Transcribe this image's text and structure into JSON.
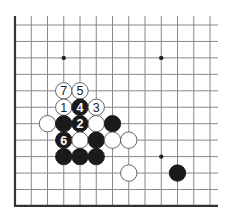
{
  "diagram": {
    "type": "go-board-fragment",
    "grid": {
      "columns": 13,
      "rows": 12,
      "origin_x": 15,
      "origin_y": 25,
      "spacing_x": 16.25,
      "spacing_y": 16.45,
      "extend_top": 9,
      "extend_right": 8,
      "left_edge": true,
      "bottom_edge": true,
      "line_color": "#888888",
      "edge_color": "#333333"
    },
    "star_points": [
      {
        "col": 3,
        "row": 2
      },
      {
        "col": 9,
        "row": 2
      },
      {
        "col": 9,
        "row": 8
      }
    ],
    "stones": [
      {
        "col": 3,
        "row": 4,
        "color": "white",
        "label": "7"
      },
      {
        "col": 4,
        "row": 4,
        "color": "white",
        "label": "5"
      },
      {
        "col": 3,
        "row": 5,
        "color": "white",
        "label": "1"
      },
      {
        "col": 4,
        "row": 5,
        "color": "black",
        "label": "4"
      },
      {
        "col": 5,
        "row": 5,
        "color": "white",
        "label": "3"
      },
      {
        "col": 2,
        "row": 6,
        "color": "white",
        "label": ""
      },
      {
        "col": 3,
        "row": 6,
        "color": "black",
        "label": ""
      },
      {
        "col": 4,
        "row": 6,
        "color": "black",
        "label": "2"
      },
      {
        "col": 5,
        "row": 6,
        "color": "white",
        "label": ""
      },
      {
        "col": 6,
        "row": 6,
        "color": "black",
        "label": ""
      },
      {
        "col": 3,
        "row": 7,
        "color": "black",
        "label": "6"
      },
      {
        "col": 4,
        "row": 7,
        "color": "white",
        "label": ""
      },
      {
        "col": 5,
        "row": 7,
        "color": "black",
        "label": ""
      },
      {
        "col": 6,
        "row": 7,
        "color": "white",
        "label": ""
      },
      {
        "col": 7,
        "row": 7,
        "color": "white",
        "label": ""
      },
      {
        "col": 3,
        "row": 8,
        "color": "black",
        "label": ""
      },
      {
        "col": 4,
        "row": 8,
        "color": "black",
        "label": ""
      },
      {
        "col": 5,
        "row": 8,
        "color": "black",
        "label": ""
      },
      {
        "col": 7,
        "row": 9,
        "color": "white",
        "label": ""
      },
      {
        "col": 10,
        "row": 9,
        "color": "black",
        "label": ""
      }
    ],
    "colors": {
      "black_stone": "#1a1a1a",
      "white_stone": "#ffffff",
      "stone_outline": "#555555"
    }
  }
}
